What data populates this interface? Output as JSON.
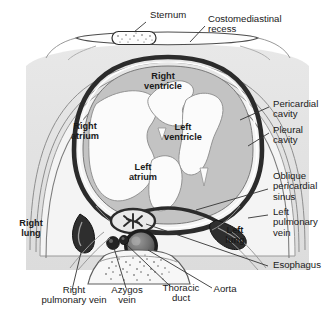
{
  "figure": {
    "type": "anatomical-cross-section",
    "view": "axial cross-section, superior view",
    "colors": {
      "background": "#ffffff",
      "body_fill": "#e3e3e3",
      "lung_fill": "#f2f2f2",
      "pericardial_sac": "#2b2b2b",
      "myocardium": "#b9b9b9",
      "chamber_lumen": "#fbfbfb",
      "vessel_wall": "#2b2b2b",
      "text": "#1a1a1a",
      "leader_line": "#333333"
    }
  },
  "labels": {
    "external": [
      {
        "id": "sternum",
        "text": "Sternum",
        "align": "left"
      },
      {
        "id": "costomediastinal-recess",
        "text": "Costomediastinal\nrecess",
        "align": "left"
      },
      {
        "id": "pericardial-cavity",
        "text": "Pericardial\ncavity",
        "align": "left"
      },
      {
        "id": "pleural-cavity",
        "text": "Pleural\ncavity",
        "align": "left"
      },
      {
        "id": "oblique-pericardial-sinus",
        "text": "Oblique\npericardial\nsinus",
        "align": "left"
      },
      {
        "id": "left-pulmonary-vein",
        "text": "Left\npulmonary\nvein",
        "align": "left"
      },
      {
        "id": "esophagus",
        "text": "Esophagus",
        "align": "left"
      },
      {
        "id": "right-pulmonary-vein",
        "text": "Right\npulmonary vein",
        "align": "center"
      },
      {
        "id": "azygos-vein",
        "text": "Azygos\nvein",
        "align": "center"
      },
      {
        "id": "thoracic-duct",
        "text": "Thoracic\nduct",
        "align": "center"
      },
      {
        "id": "aorta",
        "text": "Aorta",
        "align": "center"
      }
    ],
    "internal": [
      {
        "id": "right-ventricle",
        "text": "Right\nventricle"
      },
      {
        "id": "left-ventricle",
        "text": "Left\nventricle"
      },
      {
        "id": "right-atrium",
        "text": "Right\natrium"
      },
      {
        "id": "left-atrium",
        "text": "Left\natrium"
      },
      {
        "id": "right-lung",
        "text": "Right\nlung"
      },
      {
        "id": "left-lung",
        "text": "Left\nlung"
      }
    ]
  },
  "structures": [
    {
      "id": "sternum",
      "name": "Sternum",
      "texture": "stippled trabecular bone"
    },
    {
      "id": "vertebral-body",
      "name": "Vertebral body",
      "texture": "stippled trabecular bone"
    },
    {
      "id": "aorta",
      "name": "Descending aorta",
      "shape": "thick-walled ring"
    },
    {
      "id": "esophagus",
      "name": "Esophagus",
      "shape": "oval with stellate lumen"
    },
    {
      "id": "azygos-vein",
      "name": "Azygos vein",
      "shape": "small round vessel"
    },
    {
      "id": "thoracic-duct",
      "name": "Thoracic duct",
      "shape": "small round vessel"
    }
  ]
}
